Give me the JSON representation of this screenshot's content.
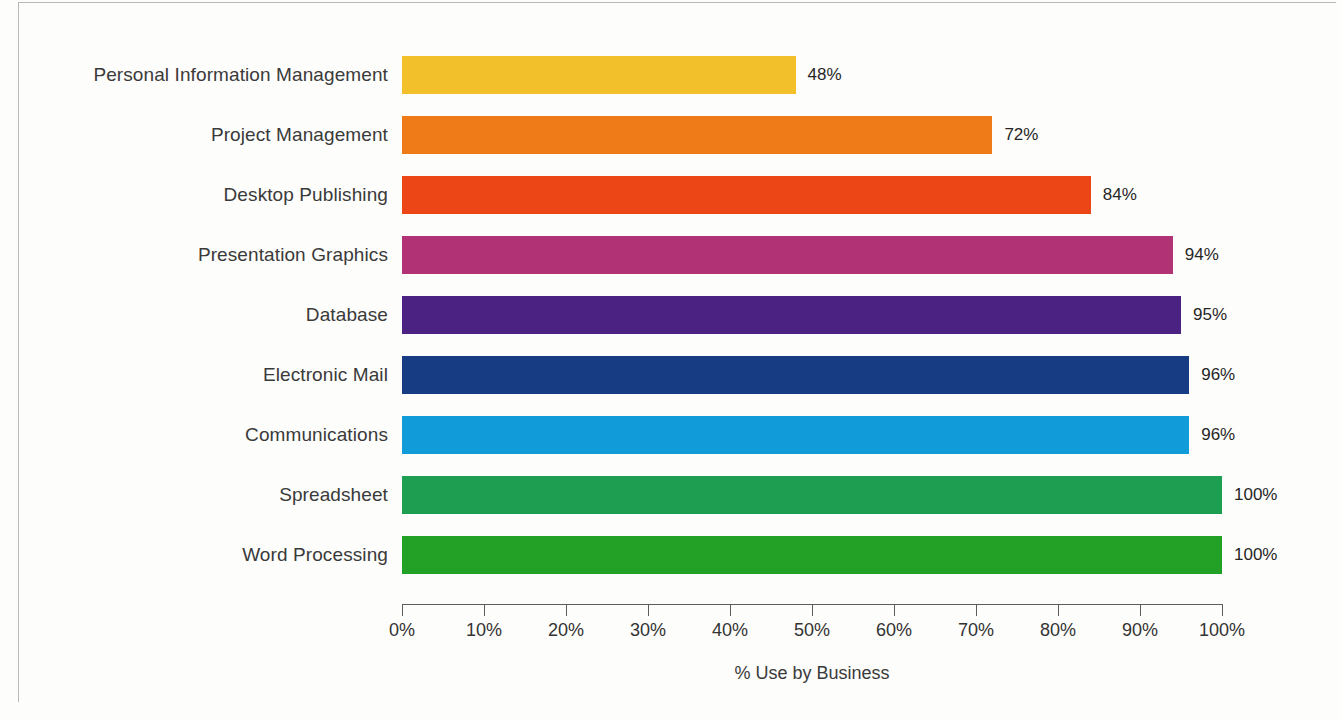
{
  "chart_data": {
    "type": "bar",
    "orientation": "horizontal",
    "title": "",
    "xlabel": "% Use by Business",
    "ylabel": "",
    "xlim": [
      0,
      100
    ],
    "grid": false,
    "legend": null,
    "value_suffix": "%",
    "axis_ticks": [
      "0%",
      "10%",
      "20%",
      "30%",
      "40%",
      "50%",
      "60%",
      "70%",
      "80%",
      "90%",
      "100%"
    ],
    "axis_tick_values": [
      0,
      10,
      20,
      30,
      40,
      50,
      60,
      70,
      80,
      90,
      100
    ],
    "categories": [
      "Personal Information Management",
      "Project Management",
      "Desktop Publishing",
      "Presentation Graphics",
      "Database",
      "Electronic Mail",
      "Communications",
      "Spreadsheet",
      "Word Processing"
    ],
    "values": [
      48,
      72,
      84,
      94,
      95,
      96,
      96,
      100,
      100
    ],
    "value_labels": [
      "48%",
      "72%",
      "84%",
      "94%",
      "95%",
      "96%",
      "96%",
      "100%",
      "100%"
    ],
    "colors": [
      "#f2c02b",
      "#ef7b18",
      "#ec4516",
      "#b23276",
      "#4b2182",
      "#183c84",
      "#119bd9",
      "#1e9e51",
      "#23a026"
    ],
    "bars": [
      {
        "label": "Personal Information Management",
        "value": 48,
        "value_label": "48%",
        "color": "#f2c02b"
      },
      {
        "label": "Project Management",
        "value": 72,
        "value_label": "72%",
        "color": "#ef7b18"
      },
      {
        "label": "Desktop Publishing",
        "value": 84,
        "value_label": "84%",
        "color": "#ec4516"
      },
      {
        "label": "Presentation Graphics",
        "value": 94,
        "value_label": "94%",
        "color": "#b23276"
      },
      {
        "label": "Database",
        "value": 95,
        "value_label": "95%",
        "color": "#4b2182"
      },
      {
        "label": "Electronic Mail",
        "value": 96,
        "value_label": "96%",
        "color": "#183c84"
      },
      {
        "label": "Communications",
        "value": 96,
        "value_label": "96%",
        "color": "#119bd9"
      },
      {
        "label": "Spreadsheet",
        "value": 100,
        "value_label": "100%",
        "color": "#1e9e51"
      },
      {
        "label": "Word Processing",
        "value": 100,
        "value_label": "100%",
        "color": "#23a026"
      }
    ]
  },
  "layout": {
    "plot_left_px": 402,
    "plot_right_px": 1222,
    "first_bar_top_px": 56,
    "bar_height_px": 38,
    "bar_pitch_px": 60
  }
}
